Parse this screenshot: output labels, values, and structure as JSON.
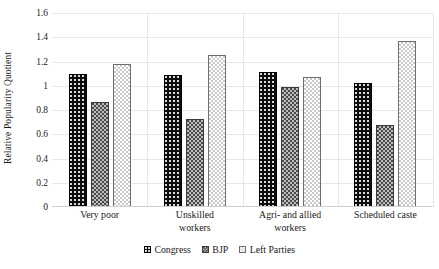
{
  "chart_data": {
    "type": "bar",
    "title": "",
    "xlabel": "",
    "ylabel": "Relative Popularity Quotient",
    "ylim": [
      0,
      1.6
    ],
    "ytick_step": 0.2,
    "yticks": [
      "0",
      "0.2",
      "0.4",
      "0.6",
      "0.8",
      "1",
      "1.2",
      "1.4",
      "1.6"
    ],
    "ytick_values": [
      0,
      0.2,
      0.4,
      0.6,
      0.8,
      1.0,
      1.2,
      1.4,
      1.6
    ],
    "grid": "horizontal-and-group-dividers",
    "legend_position": "bottom-center",
    "categories": [
      "Very poor",
      "Unskilled workers",
      "Agri- and allied workers",
      "Scheduled caste"
    ],
    "category_lines": [
      [
        "Very poor"
      ],
      [
        "Unskilled",
        "workers"
      ],
      [
        "Agri- and allied",
        "workers"
      ],
      [
        "Scheduled caste"
      ]
    ],
    "series": [
      {
        "name": "Congress",
        "values": [
          1.1,
          1.09,
          1.11,
          1.02
        ]
      },
      {
        "name": "BJP",
        "values": [
          0.87,
          0.73,
          0.99,
          0.68
        ]
      },
      {
        "name": "Left Parties",
        "values": [
          1.18,
          1.25,
          1.07,
          1.37
        ]
      }
    ]
  },
  "legend": {
    "items": [
      {
        "label": "Congress",
        "style": "normal",
        "swatch": "dotted-black-swatch"
      },
      {
        "label": "BJP",
        "style": "small-caps",
        "swatch": "checkered-gray-swatch"
      },
      {
        "label": "Left Parties",
        "style": "normal",
        "swatch": "dotted-white-swatch"
      }
    ]
  },
  "colors": {
    "congress": "#0d0d0d",
    "bjp": "#4a4a4a",
    "left_parties": "#ffffff",
    "gridline": "#e6e6e6",
    "text": "#1a1a1a",
    "background": "#ffffff"
  }
}
